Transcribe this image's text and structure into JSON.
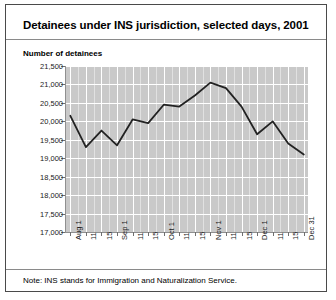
{
  "figure": {
    "title": "Detainees under INS jurisdiction, selected days, 2001",
    "axis_title": "Number of detainees",
    "note": "Note: INS stands for Immigration and Naturalization Service.",
    "colors": {
      "plot_background": "#c9c9c9",
      "gridline": "#ffffff",
      "line": "#222222",
      "border": "#4a4a4a",
      "text": "#000000"
    }
  },
  "chart_data": {
    "type": "line",
    "title": "Detainees under INS jurisdiction, selected days, 2001",
    "xlabel": "",
    "ylabel": "Number of detainees",
    "ylim": [
      17000,
      21500
    ],
    "ytick_values": [
      17000,
      17500,
      18000,
      18500,
      19000,
      19500,
      20000,
      20500,
      21000,
      21500
    ],
    "ytick_labels": [
      "17,000",
      "17,500",
      "18,000",
      "18,500",
      "19,000",
      "19,500",
      "20,000",
      "20,500",
      "21,000",
      "21,500"
    ],
    "grid": true,
    "legend": false,
    "xtick_labels": [
      "Aug 1",
      "11",
      "15",
      "Sep 1",
      "11",
      "15",
      "Oct 1",
      "11",
      "15",
      "Nov 1",
      "11",
      "15",
      "Dec 1",
      "11",
      "15",
      "Dec 31"
    ],
    "x": [
      "Aug 1",
      "11",
      "15",
      "Sep 1",
      "11",
      "15",
      "Oct 1",
      "11",
      "15",
      "Nov 1",
      "11",
      "15",
      "Dec 1",
      "11",
      "15",
      "Dec 31"
    ],
    "values": [
      20150,
      19300,
      19750,
      19350,
      20050,
      19950,
      20450,
      20400,
      20700,
      21050,
      20900,
      20400,
      19650,
      20000,
      19400,
      19100
    ],
    "series": [
      {
        "name": "Detainees under INS jurisdiction",
        "values": [
          20150,
          19300,
          19750,
          19350,
          20050,
          19950,
          20450,
          20400,
          20700,
          21050,
          20900,
          20400,
          19650,
          20000,
          19400,
          19100
        ]
      }
    ]
  }
}
